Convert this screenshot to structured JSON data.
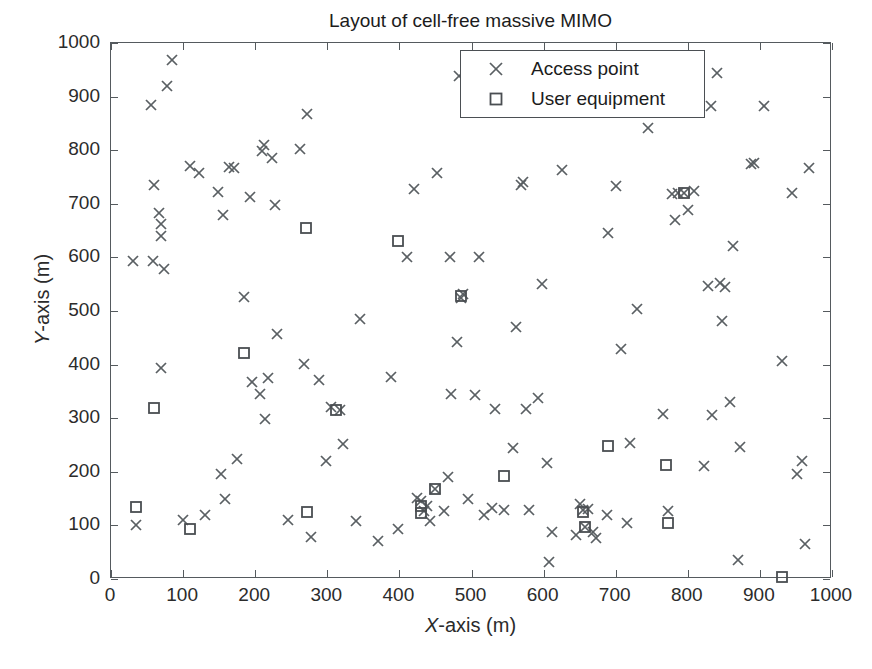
{
  "title": "Layout of cell-free massive MIMO",
  "axes": {
    "xlabel_var": "X",
    "xlabel_rest": "-axis (m)",
    "ylabel_var": "Y",
    "ylabel_rest": "-axis (m)"
  },
  "legend": {
    "entries": [
      {
        "label": "Access point",
        "marker": "x-marker-icon"
      },
      {
        "label": "User equipment",
        "marker": "square-marker-icon"
      }
    ]
  },
  "chart_data": {
    "type": "scatter",
    "title": "Layout of cell-free massive MIMO",
    "xlabel": "X-axis (m)",
    "ylabel": "Y-axis (m)",
    "xlim": [
      0,
      1000
    ],
    "ylim": [
      0,
      1000
    ],
    "xticks": [
      0,
      100,
      200,
      300,
      400,
      500,
      600,
      700,
      800,
      900,
      1000
    ],
    "yticks": [
      0,
      100,
      200,
      300,
      400,
      500,
      600,
      700,
      800,
      900,
      1000
    ],
    "grid": false,
    "legend_position": "top-center",
    "series": [
      {
        "name": "Access point",
        "marker": "x",
        "color": "#5a5f63",
        "count": 128,
        "points": [
          [
            30,
            593
          ],
          [
            34,
            100
          ],
          [
            56,
            885
          ],
          [
            58,
            594
          ],
          [
            60,
            736
          ],
          [
            66,
            682
          ],
          [
            69,
            663
          ],
          [
            70,
            640
          ],
          [
            70,
            394
          ],
          [
            74,
            578
          ],
          [
            77,
            919
          ],
          [
            85,
            969
          ],
          [
            100,
            111
          ],
          [
            110,
            770
          ],
          [
            122,
            758
          ],
          [
            130,
            120
          ],
          [
            148,
            722
          ],
          [
            152,
            195
          ],
          [
            155,
            680
          ],
          [
            158,
            150
          ],
          [
            163,
            769
          ],
          [
            170,
            767
          ],
          [
            175,
            224
          ],
          [
            185,
            527
          ],
          [
            193,
            712
          ],
          [
            196,
            367
          ],
          [
            206,
            345
          ],
          [
            210,
            798
          ],
          [
            212,
            810
          ],
          [
            214,
            299
          ],
          [
            218,
            375
          ],
          [
            223,
            785
          ],
          [
            228,
            697
          ],
          [
            230,
            458
          ],
          [
            245,
            110
          ],
          [
            262,
            803
          ],
          [
            268,
            402
          ],
          [
            272,
            868
          ],
          [
            278,
            78
          ],
          [
            288,
            371
          ],
          [
            298,
            221
          ],
          [
            305,
            320
          ],
          [
            318,
            315
          ],
          [
            322,
            252
          ],
          [
            340,
            108
          ],
          [
            345,
            485
          ],
          [
            370,
            70
          ],
          [
            388,
            376
          ],
          [
            398,
            94
          ],
          [
            410,
            600
          ],
          [
            420,
            728
          ],
          [
            424,
            151
          ],
          [
            430,
            145
          ],
          [
            434,
            126
          ],
          [
            438,
            137
          ],
          [
            442,
            108
          ],
          [
            450,
            168
          ],
          [
            452,
            757
          ],
          [
            462,
            127
          ],
          [
            468,
            190
          ],
          [
            470,
            600
          ],
          [
            472,
            345
          ],
          [
            480,
            442
          ],
          [
            482,
            939
          ],
          [
            485,
            524
          ],
          [
            488,
            532
          ],
          [
            495,
            150
          ],
          [
            505,
            344
          ],
          [
            510,
            601
          ],
          [
            518,
            120
          ],
          [
            522,
            873
          ],
          [
            528,
            133
          ],
          [
            532,
            318
          ],
          [
            538,
            905
          ],
          [
            545,
            128
          ],
          [
            552,
            907
          ],
          [
            558,
            245
          ],
          [
            562,
            470
          ],
          [
            568,
            735
          ],
          [
            572,
            741
          ],
          [
            575,
            318
          ],
          [
            580,
            128
          ],
          [
            592,
            337
          ],
          [
            598,
            550
          ],
          [
            605,
            217
          ],
          [
            608,
            31
          ],
          [
            612,
            88
          ],
          [
            625,
            763
          ],
          [
            645,
            83
          ],
          [
            650,
            140
          ],
          [
            655,
            129
          ],
          [
            658,
            97
          ],
          [
            662,
            130
          ],
          [
            668,
            88
          ],
          [
            672,
            77
          ],
          [
            688,
            120
          ],
          [
            690,
            645
          ],
          [
            700,
            733
          ],
          [
            708,
            430
          ],
          [
            715,
            104
          ],
          [
            720,
            253
          ],
          [
            730,
            504
          ],
          [
            745,
            841
          ],
          [
            765,
            307
          ],
          [
            772,
            127
          ],
          [
            778,
            719
          ],
          [
            782,
            669
          ],
          [
            786,
            721
          ],
          [
            795,
            721
          ],
          [
            800,
            688
          ],
          [
            808,
            723
          ],
          [
            822,
            210
          ],
          [
            828,
            547
          ],
          [
            832,
            883
          ],
          [
            834,
            306
          ],
          [
            840,
            944
          ],
          [
            844,
            553
          ],
          [
            848,
            481
          ],
          [
            852,
            545
          ],
          [
            858,
            330
          ],
          [
            862,
            622
          ],
          [
            870,
            35
          ],
          [
            872,
            247
          ],
          [
            888,
            775
          ],
          [
            892,
            777
          ],
          [
            905,
            883
          ],
          [
            930,
            406
          ],
          [
            945,
            721
          ],
          [
            952,
            196
          ],
          [
            958,
            220
          ],
          [
            962,
            65
          ],
          [
            968,
            766
          ]
        ]
      },
      {
        "name": "User equipment",
        "marker": "square",
        "color": "#4a4e52",
        "count": 20,
        "points": [
          [
            35,
            135
          ],
          [
            60,
            319
          ],
          [
            110,
            93
          ],
          [
            185,
            421
          ],
          [
            270,
            655
          ],
          [
            272,
            125
          ],
          [
            312,
            315
          ],
          [
            398,
            631
          ],
          [
            430,
            137
          ],
          [
            430,
            123
          ],
          [
            450,
            168
          ],
          [
            485,
            528
          ],
          [
            545,
            192
          ],
          [
            655,
            125
          ],
          [
            658,
            97
          ],
          [
            690,
            249
          ],
          [
            770,
            213
          ],
          [
            772,
            105
          ],
          [
            795,
            721
          ],
          [
            930,
            3
          ]
        ]
      }
    ]
  }
}
